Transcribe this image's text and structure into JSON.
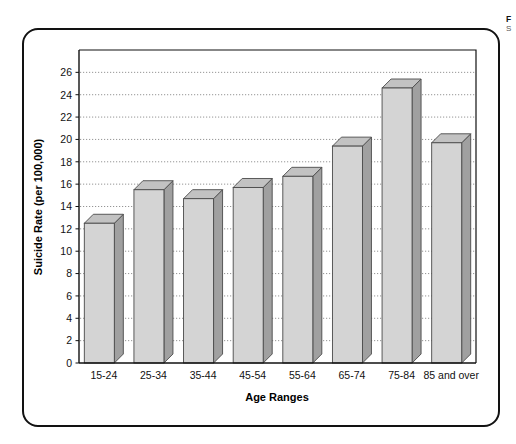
{
  "caption": {
    "title": "F",
    "subtitle": "S"
  },
  "chart_data": {
    "type": "bar",
    "title": "",
    "xlabel": "Age Ranges",
    "ylabel": "Suicide Rate (per 100,000)",
    "categories": [
      "15-24",
      "25-34",
      "35-44",
      "45-54",
      "55-64",
      "65-74",
      "75-84",
      "85 and over"
    ],
    "values": [
      12.5,
      15.5,
      14.7,
      15.7,
      16.7,
      19.4,
      24.6,
      19.7
    ],
    "ylim": [
      0,
      28
    ],
    "ytick_values": [
      0,
      2,
      4,
      6,
      8,
      10,
      12,
      14,
      16,
      18,
      20,
      22,
      24,
      26
    ],
    "ytick_labels": [
      "0",
      "2",
      "4",
      "6",
      "8",
      "10",
      "12",
      "14",
      "16",
      "18",
      "20",
      "22",
      "24",
      "26"
    ],
    "grid": true,
    "grid_style": "dotted-horizontal",
    "legend": null,
    "legend_position": "none",
    "bar_style": "3d-isometric",
    "colors": {
      "bar_front": "#d4d4d4",
      "bar_side": "#a0a0a0",
      "bar_top": "#c2c2c2",
      "bar_outline": "#4a4a4a",
      "grid": "#7a7a7a",
      "axis": "#111111",
      "frame": "#121212",
      "background": "#ffffff"
    }
  }
}
